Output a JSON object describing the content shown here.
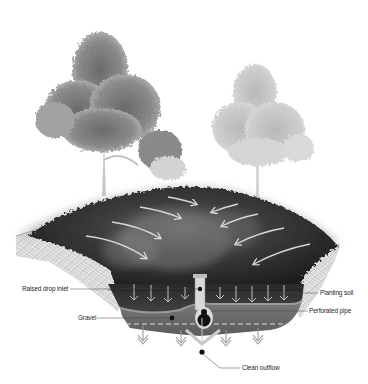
{
  "diagram": {
    "type": "cross-section illustration",
    "colors": {
      "background": "#ffffff",
      "earth_hatch": "#cfcfcf",
      "vegetation_dark": "#2e2e2e",
      "vegetation_mid": "#5a5a5a",
      "soil": "#3a3a3a",
      "gravel": "#6b6b6b",
      "arrow": "#d8d8d8",
      "label_text": "#1e1e1e"
    },
    "labels": {
      "raised_drop_inlet": "Raised drop inlet",
      "gravel": "Gravel",
      "planting_soil": "Planting soil",
      "perforated_pipe": "Perforated pipe",
      "clean_outflow": "Clean outflow"
    },
    "elements": {
      "trees": [
        "large tree (left)",
        "faded tree (right)"
      ],
      "surface_flow_arrows": 8,
      "infiltration_arrows_soil": 10,
      "infiltration_arrows_gravel": 6
    }
  }
}
